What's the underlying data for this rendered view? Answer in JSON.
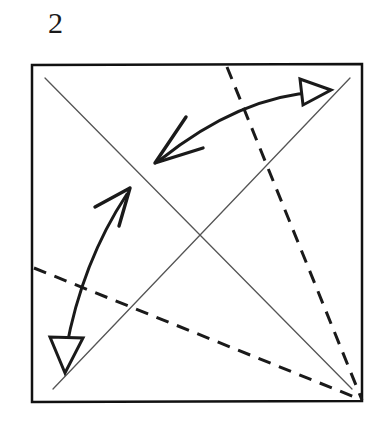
{
  "figure": {
    "type": "origami-step-diagram",
    "step_number": "2",
    "background_color": "#ffffff",
    "ink_color": "#1a1a1a",
    "thin_line_color": "#4a4a4a",
    "canvas": {
      "width": 392,
      "height": 428
    }
  },
  "paper": {
    "name": "square-sheet",
    "corners": {
      "top_left": [
        32,
        65
      ],
      "top_right": [
        362,
        64
      ],
      "bottom_right": [
        362,
        401
      ],
      "bottom_left": [
        32,
        402
      ]
    },
    "border_width": 2.5,
    "border_color": "#111111"
  },
  "crease_lines": [
    {
      "name": "crease-diagonal-tl-br",
      "style": "solid-thin",
      "meaning": "existing crease",
      "from": [
        45,
        78
      ],
      "to": [
        352,
        389
      ],
      "color": "#555555",
      "width": 1.3
    },
    {
      "name": "crease-diagonal-bl-tr",
      "style": "solid-thin",
      "meaning": "existing crease",
      "from": [
        53,
        389
      ],
      "to": [
        350,
        78
      ],
      "color": "#555555",
      "width": 1.3
    }
  ],
  "fold_lines": [
    {
      "name": "valley-fold-top-edge-to-corner",
      "style": "dashed",
      "meaning": "valley fold",
      "from": [
        227,
        67
      ],
      "to": [
        362,
        400
      ],
      "color": "#1a1a1a",
      "width": 3,
      "dash": "13 9"
    },
    {
      "name": "valley-fold-left-edge-to-corner",
      "style": "dashed",
      "meaning": "valley fold",
      "from": [
        34,
        268
      ],
      "to": [
        362,
        400
      ],
      "color": "#1a1a1a",
      "width": 3,
      "dash": "13 9"
    }
  ],
  "arrows": [
    {
      "name": "fold-arrow-upper-right",
      "meaning": "fold top edge over to diagonal crease",
      "kind": "double-headed-curved",
      "path": "M 160 160 Q 240 96 318 92",
      "color": "#1a1a1a",
      "width": 3,
      "head_start": {
        "type": "open-v",
        "tip": [
          155,
          163
        ],
        "direction": "down-left"
      },
      "head_end": {
        "type": "open-triangle",
        "tip": [
          331,
          90
        ],
        "direction": "right-up"
      }
    },
    {
      "name": "fold-arrow-lower-left",
      "meaning": "fold left edge over to diagonal crease",
      "kind": "double-headed-curved",
      "path": "M 66 350 Q 82 262 127 194",
      "color": "#1a1a1a",
      "width": 3,
      "head_start": {
        "type": "open-triangle",
        "tip": [
          65,
          373
        ],
        "direction": "down"
      },
      "head_end": {
        "type": "open-v",
        "tip": [
          130,
          188
        ],
        "direction": "up-right"
      }
    }
  ]
}
